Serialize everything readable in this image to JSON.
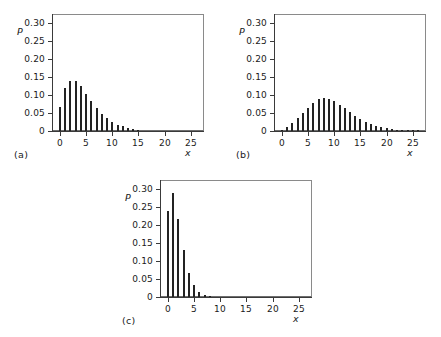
{
  "figure": {
    "axis_label_y": "P",
    "axis_label_x": "x",
    "y_ticklabels": [
      "0.30",
      "0.25",
      "0.20",
      "0.15",
      "0.10",
      "0.05",
      "0"
    ],
    "y_tickvalues": [
      0.3,
      0.25,
      0.2,
      0.15,
      0.1,
      0.05,
      0
    ],
    "x_ticklabels": [
      "0",
      "5",
      "10",
      "15",
      "20",
      "25"
    ],
    "x_tickvalues": [
      0,
      5,
      10,
      15,
      20,
      25
    ],
    "panel_labels": {
      "a": "(a)",
      "b": "(b)",
      "c": "(c)"
    },
    "bar_color": "#232323",
    "frame_color": "#6e6e6e",
    "axis_color": "#3a3a3a"
  },
  "chart_data": [
    {
      "type": "bar",
      "panel": "(a)",
      "title": "",
      "xlabel": "x",
      "ylabel": "P",
      "xlim": [
        -1.5,
        27.5
      ],
      "ylim": [
        0,
        0.325
      ],
      "grid": false,
      "legend": "none",
      "categories": [
        0,
        1,
        2,
        3,
        4,
        5,
        6,
        7,
        8,
        9,
        10,
        11,
        12,
        13,
        14,
        15,
        16,
        17,
        18,
        19,
        20,
        21,
        22,
        23,
        24,
        25,
        26,
        27
      ],
      "values": [
        0.066,
        0.12,
        0.14,
        0.14,
        0.124,
        0.103,
        0.082,
        0.063,
        0.047,
        0.035,
        0.025,
        0.018,
        0.013,
        0.009,
        0.006,
        0.004,
        0,
        0,
        0,
        0,
        0,
        0,
        0,
        0,
        0,
        0,
        0,
        0
      ]
    },
    {
      "type": "bar",
      "panel": "(b)",
      "title": "",
      "xlabel": "x",
      "ylabel": "P",
      "xlim": [
        -1.5,
        27.5
      ],
      "ylim": [
        0,
        0.325
      ],
      "grid": false,
      "legend": "none",
      "categories": [
        0,
        1,
        2,
        3,
        4,
        5,
        6,
        7,
        8,
        9,
        10,
        11,
        12,
        13,
        14,
        15,
        16,
        17,
        18,
        19,
        20,
        21,
        22,
        23,
        24,
        25,
        26,
        27
      ],
      "values": [
        0.004,
        0.011,
        0.022,
        0.035,
        0.05,
        0.064,
        0.078,
        0.088,
        0.091,
        0.089,
        0.082,
        0.073,
        0.063,
        0.052,
        0.042,
        0.033,
        0.026,
        0.019,
        0.014,
        0.01,
        0.007,
        0.005,
        0.004,
        0.003,
        0.002,
        0.001,
        0.001,
        0.0
      ]
    },
    {
      "type": "bar",
      "panel": "(c)",
      "title": "",
      "xlabel": "x",
      "ylabel": "P",
      "xlim": [
        -1.5,
        27.5
      ],
      "ylim": [
        0,
        0.325
      ],
      "grid": false,
      "legend": "none",
      "categories": [
        0,
        1,
        2,
        3,
        4,
        5,
        6,
        7,
        8,
        9,
        10,
        11,
        12,
        13,
        14,
        15,
        16,
        17,
        18,
        19,
        20,
        21,
        22,
        23,
        24,
        25,
        26,
        27
      ],
      "values": [
        0.238,
        0.288,
        0.218,
        0.13,
        0.068,
        0.032,
        0.013,
        0.006,
        0.003,
        0,
        0,
        0,
        0,
        0,
        0,
        0,
        0,
        0,
        0,
        0,
        0,
        0,
        0,
        0,
        0,
        0,
        0,
        0
      ]
    }
  ]
}
